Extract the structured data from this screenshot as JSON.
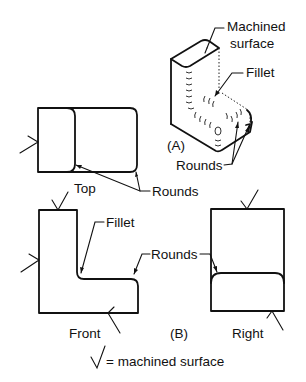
{
  "figure": {
    "part_a": {
      "caption": "(A)",
      "labels": {
        "machined_surface_line1": "Machined",
        "machined_surface_line2": "surface",
        "fillet": "Fillet",
        "rounds": "Rounds"
      }
    },
    "part_b": {
      "caption": "(B)",
      "views": {
        "top": "Top",
        "front": "Front",
        "right": "Right"
      },
      "labels": {
        "top_rounds": "Rounds",
        "front_fillet": "Fillet",
        "front_rounds": "Rounds"
      }
    },
    "legend": {
      "symbol": "√",
      "text": "= machined surface"
    }
  }
}
